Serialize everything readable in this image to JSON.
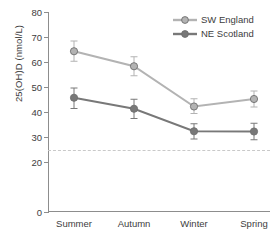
{
  "chart_data": {
    "type": "line",
    "title": "",
    "xlabel": "",
    "ylabel": "25(OH)D (nmol/L)",
    "categories": [
      "Summer",
      "Autumn",
      "Winter",
      "Spring"
    ],
    "ylim": [
      0,
      80
    ],
    "y_ticks": [
      0,
      20,
      30,
      40,
      50,
      60,
      70,
      80
    ],
    "y_tick_labels": [
      "0",
      "20",
      "30",
      "40",
      "50",
      "60",
      "70",
      "80"
    ],
    "grid": false,
    "legend_position": "top-right",
    "error_bar_type": "95% CI",
    "series": [
      {
        "name": "SW England",
        "color": "#b3b3b3",
        "values": [
          64.3,
          58.3,
          42.2,
          45.2
        ],
        "err_low": [
          60.3,
          54.5,
          39.4,
          42.0
        ],
        "err_high": [
          68.4,
          62.1,
          45.3,
          48.4
        ]
      },
      {
        "name": "NE Scotland",
        "color": "#787878",
        "values": [
          45.7,
          41.3,
          32.3,
          32.2
        ],
        "err_low": [
          41.4,
          37.4,
          29.2,
          28.9
        ],
        "err_high": [
          49.6,
          45.1,
          35.3,
          35.5
        ]
      }
    ],
    "reference_line": {
      "value": 25,
      "style": "dashed",
      "color": "#c9c9c9"
    }
  },
  "legend": {
    "items": [
      {
        "label": "SW England",
        "color": "#b3b3b3"
      },
      {
        "label": "NE Scotland",
        "color": "#787878"
      }
    ]
  }
}
